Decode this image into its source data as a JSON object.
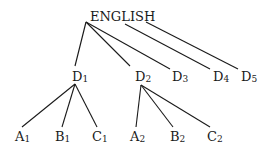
{
  "diagram": {
    "type": "tree",
    "root": {
      "label": "ENGLISH",
      "x": 90,
      "y": 10
    },
    "level1": [
      {
        "id": "D1",
        "base": "D",
        "sub": "1",
        "x": 72,
        "y": 70
      },
      {
        "id": "D2",
        "base": "D",
        "sub": "2",
        "x": 135,
        "y": 70
      },
      {
        "id": "D3",
        "base": "D",
        "sub": "3",
        "x": 172,
        "y": 70
      },
      {
        "id": "D4",
        "base": "D",
        "sub": "4",
        "x": 213,
        "y": 70
      },
      {
        "id": "D5",
        "base": "D",
        "sub": "5",
        "x": 241,
        "y": 70
      }
    ],
    "level2": [
      {
        "id": "A1",
        "base": "A",
        "sub": "1",
        "parent": "D1",
        "x": 15,
        "y": 130
      },
      {
        "id": "B1",
        "base": "B",
        "sub": "1",
        "parent": "D1",
        "x": 55,
        "y": 130
      },
      {
        "id": "C1",
        "base": "C",
        "sub": "1",
        "parent": "D1",
        "x": 92,
        "y": 130
      },
      {
        "id": "A2",
        "base": "A",
        "sub": "2",
        "parent": "D2",
        "x": 130,
        "y": 130
      },
      {
        "id": "B2",
        "base": "B",
        "sub": "2",
        "parent": "D2",
        "x": 170,
        "y": 130
      },
      {
        "id": "C2",
        "base": "C",
        "sub": "2",
        "parent": "D2",
        "x": 207,
        "y": 130
      }
    ],
    "edges": [
      {
        "from": "ENGLISH",
        "to": "D1",
        "x1": 86,
        "y1": 22,
        "x2": 75,
        "y2": 66
      },
      {
        "from": "ENGLISH",
        "to": "D2",
        "x1": 86,
        "y1": 22,
        "x2": 130,
        "y2": 66
      },
      {
        "from": "ENGLISH",
        "to": "D3",
        "x1": 86,
        "y1": 22,
        "x2": 170,
        "y2": 69
      },
      {
        "from": "ENGLISH",
        "to": "D4",
        "x1": 125,
        "y1": 24,
        "x2": 210,
        "y2": 69
      },
      {
        "from": "ENGLISH",
        "to": "D5",
        "x1": 146,
        "y1": 22,
        "x2": 238,
        "y2": 69
      },
      {
        "from": "D1",
        "to": "A1",
        "x1": 75,
        "y1": 84,
        "x2": 22,
        "y2": 127
      },
      {
        "from": "D1",
        "to": "B1",
        "x1": 75,
        "y1": 84,
        "x2": 62,
        "y2": 127
      },
      {
        "from": "D1",
        "to": "C1",
        "x1": 75,
        "y1": 84,
        "x2": 97,
        "y2": 127
      },
      {
        "from": "D2",
        "to": "A2",
        "x1": 141,
        "y1": 85,
        "x2": 136,
        "y2": 127
      },
      {
        "from": "D2",
        "to": "B2",
        "x1": 141,
        "y1": 85,
        "x2": 173,
        "y2": 127
      },
      {
        "from": "D2",
        "to": "C2",
        "x1": 141,
        "y1": 85,
        "x2": 210,
        "y2": 127
      }
    ],
    "line_color": "#1a1a1a"
  }
}
